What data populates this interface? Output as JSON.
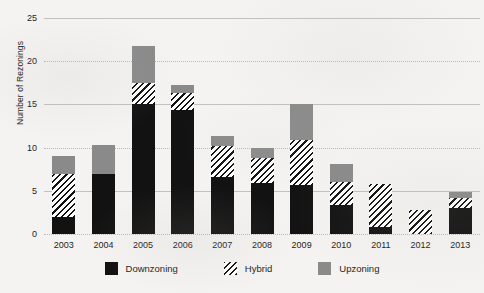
{
  "chart_data": {
    "type": "bar",
    "subtype": "stacked-bar",
    "title": "",
    "xlabel": "",
    "ylabel": "Number of Rezonings",
    "categories": [
      "2003",
      "2004",
      "2005",
      "2006",
      "2007",
      "2008",
      "2009",
      "2010",
      "2011",
      "2012",
      "2013"
    ],
    "ylim": [
      0,
      25
    ],
    "yticks": [
      0,
      5,
      10,
      15,
      20,
      25
    ],
    "ytick_labels": [
      "0",
      "5",
      "10",
      "15",
      "20",
      "25"
    ],
    "grid": true,
    "grid_axis": "y",
    "legend_position": "bottom",
    "series": [
      {
        "name": "Downzoning",
        "color": "#121212",
        "pattern": "solid",
        "values": [
          2,
          7,
          15,
          14.3,
          6.6,
          5.9,
          5.7,
          3.4,
          0.8,
          0,
          3
        ]
      },
      {
        "name": "Hybrid",
        "color": "#121212",
        "pattern": "diagonal-hatch",
        "values": [
          5,
          0,
          2.5,
          2,
          3.6,
          2.9,
          5.2,
          2.6,
          5,
          2.8,
          1.2
        ]
      },
      {
        "name": "Upzoning",
        "color": "#8a8a8a",
        "pattern": "solid",
        "values": [
          2,
          3.3,
          4.3,
          0.9,
          1.1,
          1.2,
          4.1,
          2.1,
          0,
          0,
          0.7
        ]
      }
    ],
    "totals": [
      9,
      10.3,
      21.8,
      17.2,
      11.3,
      10,
      15,
      8.1,
      5.8,
      2.8,
      4.9
    ]
  },
  "legend": {
    "items": [
      {
        "label": "Downzoning",
        "swatch": "solid-black-swatch"
      },
      {
        "label": "Hybrid",
        "swatch": "hatched-swatch"
      },
      {
        "label": "Upzoning",
        "swatch": "solid-gray-swatch"
      }
    ]
  },
  "colors": {
    "downzoning": "#121212",
    "upzoning": "#8a8a8a",
    "hybrid_line": "#121212",
    "background": "#f4f3f1",
    "gridline": "#b9b8b4",
    "text": "#1d1d1b"
  }
}
